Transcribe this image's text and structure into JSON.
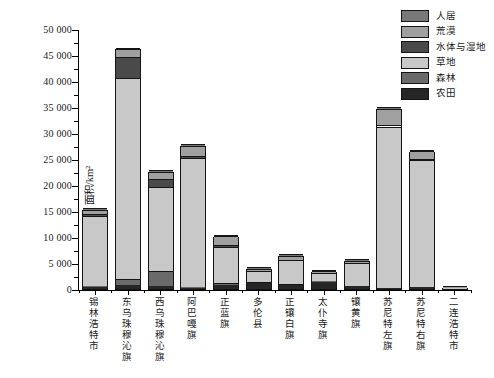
{
  "chart_data": {
    "type": "bar",
    "stacked": true,
    "title": "",
    "xlabel": "",
    "ylabel": "面积/km²",
    "ylim": [
      0,
      50000
    ],
    "ytick_step": 5000,
    "ytick_minor_step": 2500,
    "ytick_labels": [
      "0",
      "5 000",
      "10 000",
      "15 000",
      "20 000",
      "25 000",
      "30 000",
      "35 000",
      "40 000",
      "45 000",
      "50 000"
    ],
    "grid": false,
    "categories": [
      "锡林浩特市",
      "东乌珠穆沁旗",
      "西乌珠穆沁旗",
      "阿巴嘎旗",
      "正蓝旗",
      "多伦县",
      "正镶白旗",
      "太仆寺旗",
      "镶黄旗",
      "苏尼特左旗",
      "苏尼特右旗",
      "二连浩特市"
    ],
    "series": [
      {
        "name": "农田",
        "color": "#262626",
        "values": [
          400,
          700,
          500,
          200,
          800,
          1100,
          700,
          1400,
          500,
          200,
          300,
          0
        ]
      },
      {
        "name": "森林",
        "color": "#6a6a6a",
        "values": [
          100,
          1300,
          2900,
          100,
          300,
          250,
          200,
          100,
          50,
          50,
          50,
          0
        ]
      },
      {
        "name": "草地",
        "color": "#c8c8c8",
        "values": [
          13600,
          38600,
          16300,
          24900,
          6900,
          2050,
          4600,
          1600,
          4400,
          31000,
          24400,
          250
        ]
      },
      {
        "name": "水体与湿地",
        "color": "#4a4a4a",
        "values": [
          300,
          4000,
          1500,
          400,
          500,
          100,
          100,
          50,
          50,
          350,
          250,
          0
        ]
      },
      {
        "name": "荒漠",
        "color": "#a0a0a0",
        "values": [
          800,
          1500,
          1300,
          1900,
          1600,
          400,
          800,
          250,
          400,
          3100,
          1500,
          100
        ]
      },
      {
        "name": "人居",
        "color": "#787878",
        "values": [
          200,
          200,
          200,
          100,
          100,
          100,
          100,
          100,
          100,
          100,
          100,
          50
        ]
      }
    ],
    "totals": [
      15400,
      46300,
      22700,
      27600,
      10200,
      4000,
      6500,
      3500,
      5500,
      34800,
      26600,
      400
    ],
    "legend": {
      "position": "top-right",
      "order": [
        "人居",
        "荒漠",
        "水体与湿地",
        "草地",
        "森林",
        "农田"
      ]
    }
  }
}
